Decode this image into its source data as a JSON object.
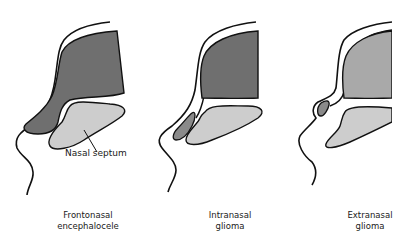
{
  "figure": {
    "panels": [
      {
        "id": "frontonasal-encephalocele",
        "line1": "Frontonasal",
        "line2": "encephalocele"
      },
      {
        "id": "intranasal-glioma",
        "line1": "Intranasal",
        "line2": "glioma"
      },
      {
        "id": "extranasal-glioma",
        "line1": "Extranasal",
        "line2": "glioma"
      }
    ],
    "annotation": {
      "nasal_septum": "Nasal septum"
    },
    "colors": {
      "brain_dark": "#6f6f6f",
      "brain_light": "#a9a9a9",
      "septum": "#cdcdcd",
      "mass": "#7a7a7a",
      "outline": "#111111"
    }
  }
}
